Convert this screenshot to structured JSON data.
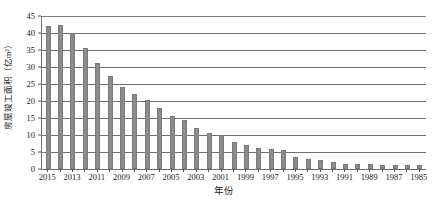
{
  "chart_data": {
    "type": "bar",
    "title": "",
    "xlabel": "年份",
    "ylabel": "房屋竣工面积（亿m²）",
    "ylim": [
      0,
      45
    ],
    "ytick_step": 5,
    "yticks": [
      0,
      5,
      10,
      15,
      20,
      25,
      30,
      35,
      40,
      45
    ],
    "ytick_labels": [
      "0",
      "5",
      "10",
      "15",
      "20",
      "25",
      "30",
      "35",
      "40",
      "45"
    ],
    "grid": "horizontal",
    "legend": "none",
    "bar_color": "#8c8c8c",
    "axis_color": "#6e6e6e",
    "gridline_color": "#6f6f6f",
    "categories": [
      "2015",
      "2014",
      "2013",
      "2012",
      "2011",
      "2010",
      "2009",
      "2008",
      "2007",
      "2006",
      "2005",
      "2004",
      "2003",
      "2002",
      "2001",
      "2000",
      "1999",
      "1998",
      "1997",
      "1996",
      "1995",
      "1994",
      "1993",
      "1992",
      "1991",
      "1990",
      "1989",
      "1988",
      "1987",
      "1986",
      "1985"
    ],
    "values": [
      42.0,
      42.3,
      40.0,
      35.7,
      31.3,
      27.5,
      24.2,
      22.1,
      20.2,
      17.9,
      15.7,
      14.5,
      12.0,
      10.7,
      10.0,
      7.9,
      7.2,
      6.3,
      5.9,
      5.7,
      3.4,
      2.9,
      2.6,
      2.1,
      1.5,
      1.5,
      1.4,
      1.2,
      1.3,
      1.2,
      1.1
    ],
    "xtick_labels": [
      "2015",
      "2013",
      "2011",
      "2009",
      "2007",
      "2005",
      "2003",
      "2001",
      "1999",
      "1997",
      "1995",
      "1993",
      "1991",
      "1989",
      "1987",
      "1985"
    ],
    "xtick_label_indices": [
      0,
      2,
      4,
      6,
      8,
      10,
      12,
      14,
      16,
      18,
      20,
      22,
      24,
      26,
      28,
      30
    ]
  }
}
